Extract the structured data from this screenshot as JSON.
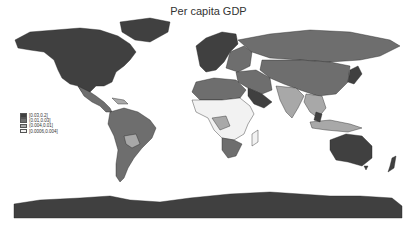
{
  "title": "Per capita GDP",
  "legend": {
    "items": [
      {
        "label": "[0.03,0.2]",
        "color": "#404040"
      },
      {
        "label": "(0.01,0.03]",
        "color": "#6e6e6e"
      },
      {
        "label": "(0.004,0.01]",
        "color": "#a8a8a8"
      },
      {
        "label": "[0.0006,0.004]",
        "color": "#f2f2f2"
      }
    ]
  },
  "colors": {
    "high": "#404040",
    "mid_high": "#6e6e6e",
    "mid_low": "#a8a8a8",
    "low": "#f2f2f2",
    "border": "#222222",
    "background": "#ffffff"
  },
  "regions": [
    {
      "name": "North America",
      "bin": "[0.03,0.2]"
    },
    {
      "name": "Mexico / Central America",
      "bin": "(0.01,0.03]"
    },
    {
      "name": "South America",
      "bin": "(0.01,0.03]"
    },
    {
      "name": "Bolivia / Paraguay",
      "bin": "(0.004,0.01]"
    },
    {
      "name": "Western Europe",
      "bin": "[0.03,0.2]"
    },
    {
      "name": "Russia / Central Asia / China",
      "bin": "(0.01,0.03]"
    },
    {
      "name": "Arabian Peninsula",
      "bin": "[0.03,0.2]"
    },
    {
      "name": "North Africa",
      "bin": "(0.01,0.03]"
    },
    {
      "name": "Sub-Saharan Africa",
      "bin": "[0.0006,0.004]"
    },
    {
      "name": "Southern Africa",
      "bin": "(0.01,0.03]"
    },
    {
      "name": "India / South Asia",
      "bin": "(0.004,0.01]"
    },
    {
      "name": "Japan / Korea",
      "bin": "[0.03,0.2]"
    },
    {
      "name": "Southeast Asia",
      "bin": "(0.004,0.01]"
    },
    {
      "name": "Australia / New Zealand",
      "bin": "[0.03,0.2]"
    },
    {
      "name": "Antarctica",
      "bin": "[0.03,0.2]"
    }
  ]
}
